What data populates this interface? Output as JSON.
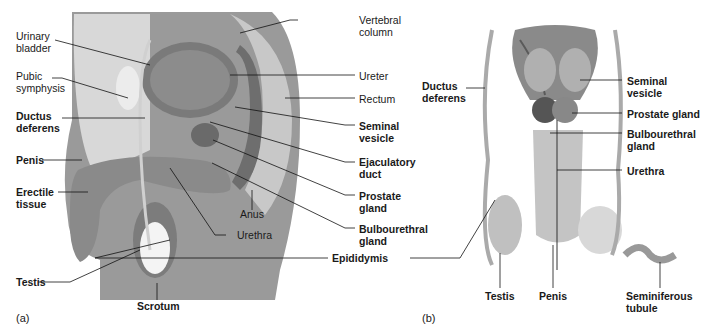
{
  "figure": {
    "panel_a": {
      "letter": "(a)",
      "labels_left": [
        {
          "id": "urinary-bladder",
          "text": "Urinary\nbladder",
          "bold": false
        },
        {
          "id": "pubic-symphysis",
          "text": "Pubic\nsymphysis",
          "bold": false
        },
        {
          "id": "ductus-deferens",
          "text": "Ductus\ndeferens",
          "bold": true
        },
        {
          "id": "penis",
          "text": "Penis",
          "bold": true
        },
        {
          "id": "erectile-tissue",
          "text": "Erectile\ntissue",
          "bold": true
        },
        {
          "id": "testis",
          "text": "Testis",
          "bold": true
        }
      ],
      "labels_bottom": [
        {
          "id": "scrotum",
          "text": "Scrotum",
          "bold": true
        },
        {
          "id": "anus",
          "text": "Anus",
          "bold": false
        },
        {
          "id": "urethra",
          "text": "Urethra",
          "bold": false
        }
      ],
      "labels_right": [
        {
          "id": "vertebral-column",
          "text": "Vertebral\ncolumn",
          "bold": false
        },
        {
          "id": "ureter",
          "text": "Ureter",
          "bold": false
        },
        {
          "id": "rectum",
          "text": "Rectum",
          "bold": false
        },
        {
          "id": "seminal-vesicle",
          "text": "Seminal\nvesicle",
          "bold": true
        },
        {
          "id": "ejaculatory-duct",
          "text": "Ejaculatory\nduct",
          "bold": true
        },
        {
          "id": "prostate-gland",
          "text": "Prostate\ngland",
          "bold": true
        },
        {
          "id": "bulbourethral-gland",
          "text": "Bulbourethral\ngland",
          "bold": true
        },
        {
          "id": "epididymis",
          "text": "Epididymis",
          "bold": true
        }
      ]
    },
    "panel_b": {
      "letter": "(b)",
      "labels_left": [
        {
          "id": "ductus-deferens",
          "text": "Ductus\ndeferens",
          "bold": true
        }
      ],
      "labels_right": [
        {
          "id": "seminal-vesicle",
          "text": "Seminal\nvesicle",
          "bold": true
        },
        {
          "id": "prostate-gland",
          "text": "Prostate gland",
          "bold": true
        },
        {
          "id": "bulbourethral-gland",
          "text": "Bulbourethral\ngland",
          "bold": true
        },
        {
          "id": "urethra",
          "text": "Urethra",
          "bold": true
        }
      ],
      "labels_bottom": [
        {
          "id": "testis",
          "text": "Testis",
          "bold": true
        },
        {
          "id": "penis",
          "text": "Penis",
          "bold": true
        },
        {
          "id": "seminiferous-tubule",
          "text": "Seminiferous\ntubule",
          "bold": true
        }
      ]
    }
  }
}
